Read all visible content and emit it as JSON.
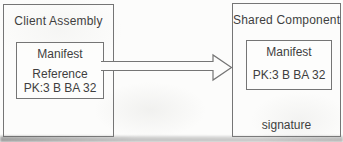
{
  "diagram": {
    "boxes": {
      "client": {
        "title": "Client Assembly",
        "manifest": {
          "title": "Manifest",
          "reference": "Reference",
          "token": "PK:3 B BA 32"
        }
      },
      "shared": {
        "title": "Shared Component",
        "manifest": {
          "title": "Manifest",
          "token": "PK:3 B BA 32"
        },
        "signature": "signature"
      }
    },
    "arrow": {
      "type": "block-arrow-right",
      "from": "client.manifest.reference",
      "to": "shared"
    }
  },
  "colors": {
    "line": "#757575",
    "text": "#3f3f3f",
    "background": "#fcfcfb"
  }
}
